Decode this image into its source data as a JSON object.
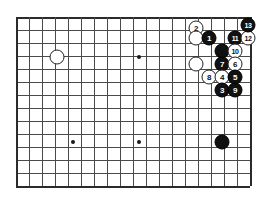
{
  "diagram": {
    "board": {
      "columns": 19,
      "rows": 14,
      "origin_x": 16,
      "origin_y": 17,
      "spacing": 13,
      "line_color": "#4a4a4a",
      "edge_color": "#2b2b2b",
      "background_color": "#ffffff",
      "star_points": [
        {
          "name": "star-point-upper-middle",
          "x": 139,
          "y": 57
        },
        {
          "name": "star-point-lower-left",
          "x": 73,
          "y": 142
        },
        {
          "name": "star-point-lower-middle",
          "x": 139,
          "y": 142
        }
      ]
    },
    "stones": [
      {
        "id": "stone-white-upper-left",
        "color": "white",
        "label": "",
        "x": 57,
        "y": 57
      },
      {
        "id": "stone-white-2",
        "color": "white",
        "label": "2",
        "x": 196,
        "y": 28
      },
      {
        "id": "stone-white-plain-a",
        "color": "white",
        "label": "",
        "x": 196,
        "y": 38
      },
      {
        "id": "stone-black-1",
        "color": "black",
        "label": "1",
        "x": 209,
        "y": 38
      },
      {
        "id": "stone-black-11",
        "color": "black",
        "label": "11",
        "x": 235,
        "y": 38
      },
      {
        "id": "stone-white-12",
        "color": "white",
        "label": "12",
        "x": 248,
        "y": 38
      },
      {
        "id": "stone-black-13",
        "color": "black",
        "label": "13",
        "x": 248,
        "y": 25
      },
      {
        "id": "stone-black-plain-b",
        "color": "black",
        "label": "",
        "x": 222,
        "y": 51
      },
      {
        "id": "stone-white-10",
        "color": "white",
        "label": "10",
        "x": 235,
        "y": 51
      },
      {
        "id": "stone-white-plain-c",
        "color": "white",
        "label": "",
        "x": 196,
        "y": 64
      },
      {
        "id": "stone-black-7",
        "color": "black",
        "label": "7",
        "x": 222,
        "y": 64
      },
      {
        "id": "stone-white-6",
        "color": "white",
        "label": "6",
        "x": 235,
        "y": 64
      },
      {
        "id": "stone-white-8",
        "color": "white",
        "label": "8",
        "x": 209,
        "y": 77
      },
      {
        "id": "stone-white-4",
        "color": "white",
        "label": "4",
        "x": 222,
        "y": 77
      },
      {
        "id": "stone-black-5",
        "color": "black",
        "label": "5",
        "x": 235,
        "y": 77
      },
      {
        "id": "stone-black-3",
        "color": "black",
        "label": "3",
        "x": 222,
        "y": 90
      },
      {
        "id": "stone-black-9",
        "color": "black",
        "label": "9",
        "x": 235,
        "y": 90
      },
      {
        "id": "stone-black-lower",
        "color": "black",
        "label": "",
        "x": 222,
        "y": 142
      }
    ]
  }
}
